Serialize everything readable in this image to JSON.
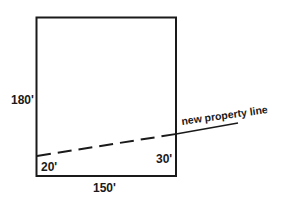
{
  "diagram": {
    "title": "",
    "shape": "rectangle lot with new property line",
    "labels": {
      "left_side": "180'",
      "bottom_side": "150'",
      "left_offset": "20'",
      "right_offset": "30'",
      "property_line": "new property line"
    },
    "colors": {
      "ink": "#1a1a1a",
      "background": "#ffffff"
    }
  }
}
